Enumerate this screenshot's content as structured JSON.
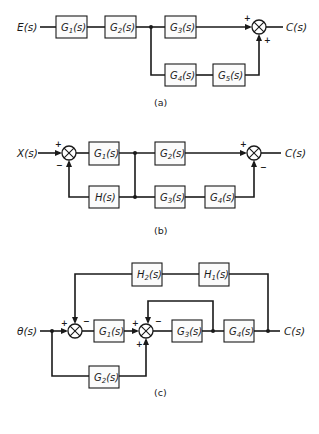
{
  "figure": {
    "panels": [
      {
        "id": "a",
        "caption": "(a)",
        "input": "E(s)",
        "output": "C(s)",
        "blocks": {
          "g1": {
            "name": "G",
            "sub": "1",
            "arg": "(s)"
          },
          "g2": {
            "name": "G",
            "sub": "2",
            "arg": "(s)"
          },
          "g3": {
            "name": "G",
            "sub": "3",
            "arg": "(s)"
          },
          "g4": {
            "name": "G",
            "sub": "4",
            "arg": "(s)"
          },
          "g5": {
            "name": "G",
            "sub": "5",
            "arg": "(s)"
          }
        },
        "summing_junctions": [
          {
            "signs": {
              "left": "+",
              "bottom": "+"
            }
          }
        ]
      },
      {
        "id": "b",
        "caption": "(b)",
        "input": "X(s)",
        "output": "C(s)",
        "blocks": {
          "g1": {
            "name": "G",
            "sub": "1",
            "arg": "(s)"
          },
          "g2": {
            "name": "G",
            "sub": "2",
            "arg": "(s)"
          },
          "g3": {
            "name": "G",
            "sub": "3",
            "arg": "(s)"
          },
          "g4": {
            "name": "G",
            "sub": "4",
            "arg": "(s)"
          },
          "h": {
            "name": "H",
            "sub": "",
            "arg": "(s)"
          }
        },
        "summing_junctions": [
          {
            "signs": {
              "left": "+",
              "bottom": "−"
            }
          },
          {
            "signs": {
              "left": "+",
              "bottom": "−"
            }
          }
        ]
      },
      {
        "id": "c",
        "caption": "(c)",
        "input": "θ(s)",
        "output": "C(s)",
        "blocks": {
          "g1": {
            "name": "G",
            "sub": "1",
            "arg": "(s)"
          },
          "g2": {
            "name": "G",
            "sub": "2",
            "arg": "(s)"
          },
          "g3": {
            "name": "G",
            "sub": "3",
            "arg": "(s)"
          },
          "g4": {
            "name": "G",
            "sub": "4",
            "arg": "(s)"
          },
          "h1": {
            "name": "H",
            "sub": "1",
            "arg": "(s)"
          },
          "h2": {
            "name": "H",
            "sub": "2",
            "arg": "(s)"
          }
        },
        "summing_junctions": [
          {
            "signs": {
              "left": "+",
              "top": "−"
            }
          },
          {
            "signs": {
              "left": "+",
              "top": "−",
              "bottom": "+"
            }
          }
        ]
      }
    ]
  }
}
